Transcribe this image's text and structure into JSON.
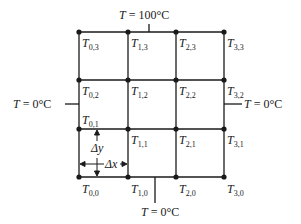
{
  "diagram": {
    "grid": {
      "x_positions": [
        79,
        128,
        176,
        224
      ],
      "y_positions": [
        32,
        80,
        129,
        177
      ],
      "line_color": "#1a1a1a",
      "node_color": "#1a1a1a"
    },
    "nodes": [
      {
        "i": 0,
        "j": 3,
        "var": "T",
        "sub": "0,3"
      },
      {
        "i": 1,
        "j": 3,
        "var": "T",
        "sub": "1,3"
      },
      {
        "i": 2,
        "j": 3,
        "var": "T",
        "sub": "2,3"
      },
      {
        "i": 3,
        "j": 3,
        "var": "T",
        "sub": "3,3"
      },
      {
        "i": 0,
        "j": 2,
        "var": "T",
        "sub": "0,2"
      },
      {
        "i": 1,
        "j": 2,
        "var": "T",
        "sub": "1,2"
      },
      {
        "i": 2,
        "j": 2,
        "var": "T",
        "sub": "2,2"
      },
      {
        "i": 3,
        "j": 2,
        "var": "T",
        "sub": "3,2"
      },
      {
        "i": 0,
        "j": 1,
        "var": "T",
        "sub": "0,1"
      },
      {
        "i": 1,
        "j": 1,
        "var": "T",
        "sub": "1,1"
      },
      {
        "i": 2,
        "j": 1,
        "var": "T",
        "sub": "2,1"
      },
      {
        "i": 3,
        "j": 1,
        "var": "T",
        "sub": "3,1"
      },
      {
        "i": 0,
        "j": 0,
        "var": "T",
        "sub": "0,0"
      },
      {
        "i": 1,
        "j": 0,
        "var": "T",
        "sub": "1,0"
      },
      {
        "i": 2,
        "j": 0,
        "var": "T",
        "sub": "2,0"
      },
      {
        "i": 3,
        "j": 0,
        "var": "T",
        "sub": "3,0"
      }
    ],
    "boundaries": {
      "top": {
        "var": "T",
        "eq": " = ",
        "value": "100°C"
      },
      "bottom": {
        "var": "T",
        "eq": " = ",
        "value": "0°C"
      },
      "left": {
        "var": "T",
        "eq": " = ",
        "value": "0°C"
      },
      "right": {
        "var": "T",
        "eq": " = ",
        "value": "0°C"
      }
    },
    "spacing": {
      "dy_label": "Δy",
      "dx_label": "Δx"
    }
  }
}
